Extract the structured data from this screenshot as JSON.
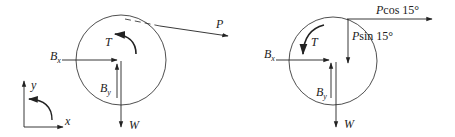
{
  "figures": [
    {
      "id": "free-body-diagram-left",
      "labels": {
        "tension_P": "P",
        "torque_T": "T",
        "reaction_Bx": "B",
        "reaction_Bx_sub": "x",
        "reaction_By": "B",
        "reaction_By_sub": "y",
        "weight_W": "W"
      },
      "axes": {
        "x_label": "x",
        "y_label": "y"
      }
    },
    {
      "id": "free-body-diagram-right",
      "labels": {
        "p_cos": "P cos 15°",
        "p_sin": "P sin 15°",
        "torque_T": "T",
        "reaction_Bx": "B",
        "reaction_Bx_sub": "x",
        "reaction_By": "B",
        "reaction_By_sub": "y",
        "weight_W": "W"
      }
    }
  ],
  "colors": {
    "stroke": "#222222",
    "background": "#ffffff"
  }
}
